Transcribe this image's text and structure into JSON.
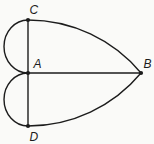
{
  "figure": {
    "background_color": "#fafaf8",
    "stroke_color": "#1c1c1c",
    "label_color": "#1c1c1c",
    "stroke_width": 1.4,
    "dot_radius": 2.1,
    "points": [
      {
        "id": "C",
        "label": "C",
        "x": 28,
        "y": 20,
        "label_x": 29.5,
        "label_y": 14
      },
      {
        "id": "A",
        "label": "A",
        "x": 28,
        "y": 73,
        "label_x": 33.5,
        "label_y": 68
      },
      {
        "id": "B",
        "label": "B",
        "x": 141,
        "y": 73,
        "label_x": 143.5,
        "label_y": 68
      },
      {
        "id": "D",
        "label": "D",
        "x": 28,
        "y": 126,
        "label_x": 29.5,
        "label_y": 141
      }
    ],
    "segments": [
      {
        "name": "segment-CD",
        "from": "C",
        "to": "D"
      },
      {
        "name": "segment-AB",
        "from": "A",
        "to": "B"
      }
    ],
    "arcs": [
      {
        "name": "small-arc-CA",
        "d": "M 28 20 A 24 26.5 0 0 0 28 73"
      },
      {
        "name": "small-arc-AD",
        "d": "M 28 73 A 24 26.5 0 0 0 28 126"
      },
      {
        "name": "big-arc-CB",
        "d": "M 28 20 A 147 147 0 0 1 141 73"
      },
      {
        "name": "big-arc-DB",
        "d": "M 28 126 A 147 147 0 0 0 141 73"
      }
    ]
  }
}
